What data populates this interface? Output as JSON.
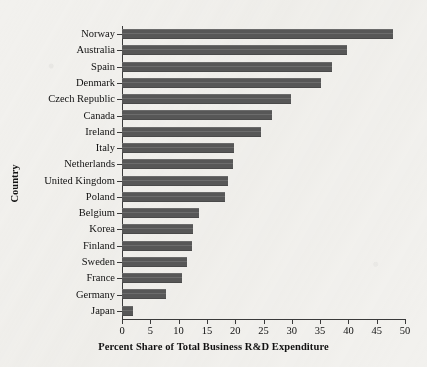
{
  "chart_data": {
    "type": "bar",
    "orientation": "horizontal",
    "title": "",
    "xlabel": "Percent Share of Total Business R&D Expenditure",
    "ylabel": "Country",
    "xlim": [
      0,
      50
    ],
    "xticks": [
      0,
      5,
      10,
      15,
      20,
      25,
      30,
      35,
      40,
      45,
      50
    ],
    "grid": false,
    "legend": null,
    "bar_color": "#575757",
    "background_color": "#f2f1ee",
    "categories": [
      "Norway",
      "Australia",
      "Spain",
      "Denmark",
      "Czech Republic",
      "Canada",
      "Ireland",
      "Italy",
      "Netherlands",
      "United Kingdom",
      "Poland",
      "Belgium",
      "Korea",
      "Finland",
      "Sweden",
      "France",
      "Germany",
      "Japan"
    ],
    "values": [
      47.9,
      39.8,
      37.1,
      35.2,
      29.8,
      26.5,
      24.6,
      19.8,
      19.6,
      18.8,
      18.2,
      13.6,
      12.5,
      12.3,
      11.5,
      10.6,
      7.8,
      2.0
    ]
  }
}
